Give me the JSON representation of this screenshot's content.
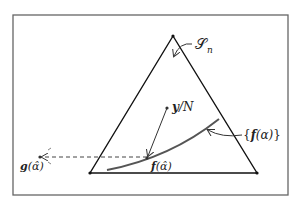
{
  "diagram": {
    "frame": {
      "x": 13,
      "y": 15,
      "width": 275,
      "height": 180,
      "color": "#555555"
    },
    "triangle": {
      "apex": [
        173,
        36
      ],
      "bottom_left": [
        90,
        173
      ],
      "bottom_right": [
        257,
        173
      ],
      "color": "#111111"
    },
    "curve": {
      "color": "#555555",
      "path": "M107,170 Q170,158 219,119"
    },
    "points": {
      "y_over_N": [
        167,
        108
      ],
      "f_alpha_hat": [
        147,
        158
      ],
      "g_alpha_hat": [
        40,
        157
      ]
    },
    "labels": {
      "simplex": "𝒮",
      "simplex_sub": "n",
      "y_over_N_bold": "y",
      "y_over_N_rest": "/N",
      "f_set_open": "{",
      "f_set_f": "f",
      "f_set_arg": "(α)",
      "f_set_close": "}",
      "f_hat_f": "f",
      "f_hat_arg": "(α̂)",
      "g_hat_g": "g",
      "g_hat_arg": "(α̂)"
    }
  }
}
